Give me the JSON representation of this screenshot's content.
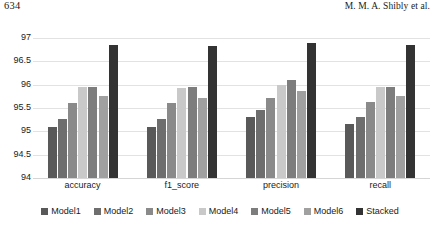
{
  "page_header": {
    "folio": "634",
    "authors": "M. M. A. Shibly et al."
  },
  "chart_data": {
    "type": "bar",
    "title": "",
    "xlabel": "",
    "ylabel": "",
    "ylim": [
      94,
      97
    ],
    "yticks": [
      "97",
      "96.5",
      "96",
      "95.5",
      "95",
      "94.5",
      "94"
    ],
    "ytick_values": [
      97,
      96.5,
      96,
      95.5,
      95,
      94.5,
      94
    ],
    "grid": true,
    "legend_position": "bottom",
    "categories": [
      "accuracy",
      "f1_score",
      "precision",
      "recall"
    ],
    "series": [
      {
        "name": "Model1",
        "color": "#595959",
        "values": [
          95.1,
          95.1,
          95.3,
          95.15
        ]
      },
      {
        "name": "Model2",
        "color": "#6e6e6e",
        "values": [
          95.27,
          95.27,
          95.45,
          95.3
        ]
      },
      {
        "name": "Model3",
        "color": "#8a8a8a",
        "values": [
          95.6,
          95.6,
          95.72,
          95.62
        ]
      },
      {
        "name": "Model4",
        "color": "#c9c9c9",
        "values": [
          95.95,
          95.93,
          96.0,
          95.95
        ]
      },
      {
        "name": "Model5",
        "color": "#7d7d7d",
        "values": [
          95.95,
          95.95,
          96.1,
          95.95
        ]
      },
      {
        "name": "Model6",
        "color": "#a0a0a0",
        "values": [
          95.75,
          95.72,
          95.87,
          95.75
        ]
      },
      {
        "name": "Stacked",
        "color": "#333333",
        "values": [
          96.85,
          96.83,
          96.9,
          96.85
        ]
      }
    ]
  }
}
